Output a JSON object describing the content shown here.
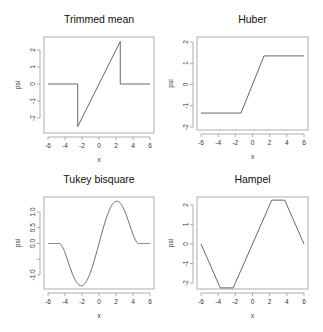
{
  "chart_data": [
    {
      "type": "line",
      "title": "Trimmed mean",
      "xlabel": "x",
      "ylabel": "psi",
      "xlim": [
        -6,
        6
      ],
      "ylim": [
        -2.5,
        2.5
      ],
      "xticks": [
        -6,
        -4,
        -2,
        0,
        2,
        4,
        6
      ],
      "yticks": [
        -2,
        -1,
        0,
        1,
        2
      ],
      "x": [
        -6,
        -2.5,
        -2.5,
        2.5,
        2.5,
        6
      ],
      "y": [
        0,
        0,
        -2.5,
        2.5,
        0,
        0
      ]
    },
    {
      "type": "line",
      "title": "Huber",
      "xlabel": "x",
      "ylabel": "psi",
      "xlim": [
        -6,
        6
      ],
      "ylim": [
        -2,
        2
      ],
      "xticks": [
        -6,
        -4,
        -2,
        0,
        2,
        4,
        6
      ],
      "yticks": [
        -2,
        -1,
        0,
        1,
        2
      ],
      "x": [
        -6,
        -1.345,
        1.345,
        6
      ],
      "y": [
        -1.345,
        -1.345,
        1.345,
        1.345
      ]
    },
    {
      "type": "line",
      "title": "Tukey bisquare",
      "xlabel": "x",
      "ylabel": "psi",
      "xlim": [
        -6,
        6
      ],
      "ylim": [
        -1.3,
        1.3
      ],
      "xticks": [
        -6,
        -4,
        -2,
        0,
        2,
        4,
        6
      ],
      "yticks": [
        -1.0,
        -0.5,
        0.0,
        0.5,
        1.0
      ],
      "ytick_labels": [
        "-1.0",
        "",
        "0.0",
        "0.5",
        "1.0"
      ],
      "function": "x*(1-(x/4.685)^2)^2 for |x|<=4.685, else 0",
      "c": 4.685
    },
    {
      "type": "line",
      "title": "Hampel",
      "xlabel": "x",
      "ylabel": "psi",
      "xlim": [
        -6,
        6
      ],
      "ylim": [
        -2.2,
        2.2
      ],
      "xticks": [
        -6,
        -4,
        -2,
        0,
        2,
        4,
        6
      ],
      "yticks": [
        -2,
        -1,
        0,
        1,
        2
      ],
      "x": [
        -6,
        -3.75,
        -2.25,
        2.25,
        3.75,
        6
      ],
      "y": [
        0,
        -2.25,
        -2.25,
        2.25,
        2.25,
        0
      ]
    }
  ],
  "panels": [
    {
      "title": "Trimmed mean",
      "xlabel": "x",
      "ylabel": "psi"
    },
    {
      "title": "Huber",
      "xlabel": "x",
      "ylabel": "psi"
    },
    {
      "title": "Tukey bisquare",
      "xlabel": "x",
      "ylabel": "psi"
    },
    {
      "title": "Hampel",
      "xlabel": "x",
      "ylabel": "psi"
    }
  ],
  "colors": {
    "curve": "#555555",
    "box": "#9a9a9a"
  }
}
